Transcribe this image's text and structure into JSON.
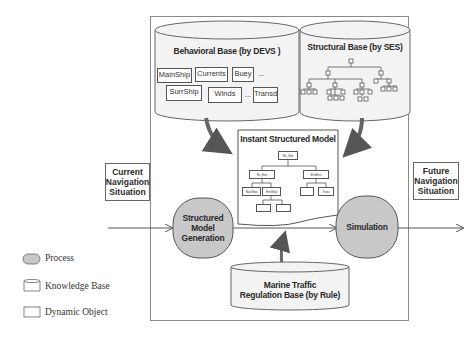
{
  "diagram": {
    "behavioral_base": {
      "title": "Behavioral Base (by DEVS )",
      "objects_row1": [
        "MainShip",
        "Currents",
        "Buey",
        "..."
      ],
      "objects_row2": [
        "SurrShip",
        "Winds",
        "...",
        "Transd"
      ]
    },
    "structural_base": {
      "title": "Structural Base (by SES)"
    },
    "instant_model": {
      "title": "Instant Structured Model",
      "nodes": [
        "Nv_Sim",
        "Nv_Env",
        "EnvEnv",
        "NavShip",
        "EnvShip",
        "Trans"
      ]
    },
    "current_situation": "Current Navigation Situation",
    "future_situation": "Future Navigation Situation",
    "process_generation": "Structured Model Generation",
    "process_simulation": "Simulation",
    "rule_base": {
      "line1": "Marine Traffic",
      "line2": "Regulation Base  (by Rule)"
    },
    "colors": {
      "process_fill": "#c8c8c8",
      "line": "#555555",
      "frame": "#8a8a8a"
    }
  },
  "legend": {
    "items": [
      {
        "icon": "process-shape-icon",
        "label": "Process"
      },
      {
        "icon": "knowledge-base-shape-icon",
        "label": "Knowledge Base"
      },
      {
        "icon": "dynamic-object-shape-icon",
        "label": "Dynamic Object"
      }
    ]
  }
}
